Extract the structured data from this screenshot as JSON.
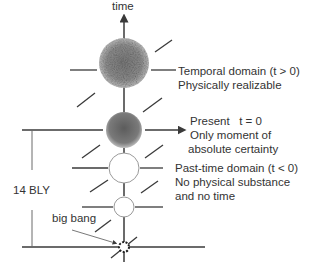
{
  "diagram": {
    "axis_label": "time",
    "span_label": "14 BLY",
    "origin_label": "big bang",
    "domains": [
      {
        "id": "future",
        "lines": [
          "Temporal domain (t > 0)",
          "Physically realizable"
        ]
      },
      {
        "id": "present",
        "lines": [
          "Present   t = 0",
          "Only moment of",
          "absolute certainty"
        ]
      },
      {
        "id": "past",
        "lines": [
          "Past-time domain (t < 0)",
          "No physical substance",
          "and no time"
        ]
      }
    ],
    "colors": {
      "line": "#3a3a3a",
      "text": "#333333",
      "future_sphere": "#8a8a8a",
      "present_sphere": "#6e6e6e",
      "past_circle_stroke": "#9a9a9a"
    }
  }
}
